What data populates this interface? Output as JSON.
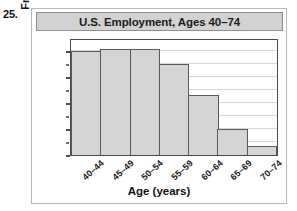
{
  "problem_number": "25.",
  "chart_data": {
    "type": "bar",
    "title": "U.S. Employment, Ages 40–74",
    "xlabel": "Age (years)",
    "ylabel": "Frequency (millions)",
    "categories": [
      "40–44",
      "45–49",
      "50–54",
      "55–59",
      "60–64",
      "65–69",
      "70–74"
    ],
    "values": [
      16.0,
      16.3,
      16.3,
      14.0,
      9.2,
      4.0,
      1.4
    ],
    "ylim": [
      0,
      18
    ],
    "ytick_labels": [
      "0",
      "4",
      "8",
      "12",
      "16"
    ],
    "ytick_values": [
      0,
      4,
      8,
      12,
      16
    ],
    "gridline_values": [
      2,
      4,
      6,
      8,
      10,
      12,
      14,
      16
    ],
    "grid": true,
    "legend": false,
    "bar_fill_color": "#d5d5d5",
    "bar_edge_color": "#585858",
    "title_banner_color": "#d2d2d2",
    "axis_color": "#4a4a4a",
    "gridline_color": "#d8d8d8"
  }
}
